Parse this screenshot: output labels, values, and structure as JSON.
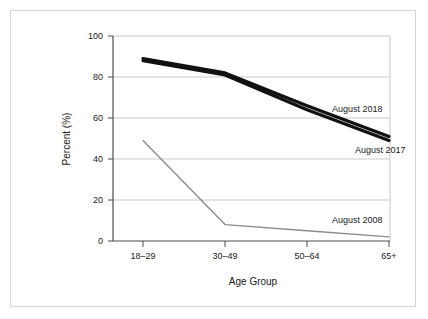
{
  "chart_data": {
    "type": "line",
    "title": "",
    "subtitle": "",
    "xlabel": "Age Group",
    "ylabel": "Percent (%)",
    "categories": [
      "18–29",
      "30–49",
      "50–64",
      "65+"
    ],
    "ylim": [
      0,
      100
    ],
    "yticks": [
      "0",
      "20",
      "40",
      "60",
      "80",
      "100"
    ],
    "ytick_values": [
      0,
      20,
      40,
      60,
      80,
      100
    ],
    "grid": "horizontal",
    "legend": "inline-end-labels",
    "series": [
      {
        "name": "August 2018",
        "values": [
          89,
          82,
          66,
          51
        ],
        "color": "#111111",
        "width": 3.2,
        "label_x": 332,
        "label_y": 112
      },
      {
        "name": "August 2017",
        "values": [
          88,
          81,
          64,
          49
        ],
        "color": "#111111",
        "width": 3.2,
        "label_x": 355,
        "label_y": 153
      },
      {
        "name": "August 2008",
        "values": [
          49,
          8,
          5,
          2
        ],
        "color": "#8c8c8c",
        "width": 1.4,
        "label_x": 332,
        "label_y": 223
      }
    ]
  },
  "figure": {
    "background_color": "#ffffff",
    "frame_color": "#d4d4d4",
    "axis_color": "#4d4d4d",
    "grid_color": "#c9c9c9",
    "text_color": "#1a1a1a"
  },
  "axis": {
    "y_title": "Percent (%)",
    "x_title": "Age Group"
  },
  "ticks": {
    "y": [
      "100",
      "80",
      "60",
      "40",
      "20",
      "0"
    ],
    "x": [
      "18–29",
      "30–49",
      "50–64",
      "65+"
    ]
  },
  "labels": {
    "series_2018": "August 2018",
    "series_2017": "August 2017",
    "series_2008": "August 2008"
  }
}
